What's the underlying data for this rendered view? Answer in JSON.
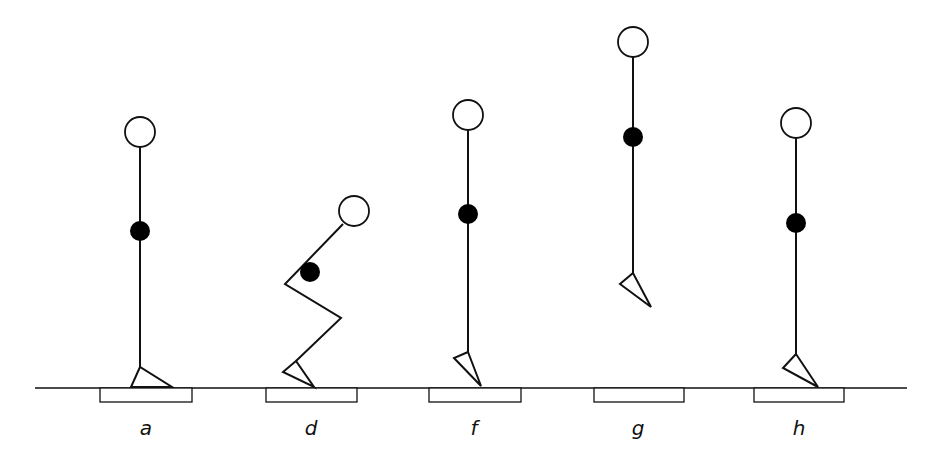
{
  "diagram": {
    "stroke_color": "#111111",
    "com_color": "#000000",
    "head_fill": "#ffffff",
    "ground": {
      "x1": 35,
      "x2": 907,
      "y": 388
    },
    "figures": [
      {
        "label": "a",
        "label_x": 146,
        "plate": {
          "x": 100,
          "w": 92
        },
        "head": {
          "cx": 140,
          "cy": 132,
          "r": 15
        },
        "body": [
          [
            140,
            147
          ],
          [
            140,
            371
          ]
        ],
        "com": {
          "cx": 140,
          "cy": 231,
          "r": 10
        },
        "foot": [
          [
            140,
            367
          ],
          [
            131,
            387
          ],
          [
            172,
            387
          ]
        ]
      },
      {
        "label": "d",
        "label_x": 311,
        "plate": {
          "x": 266,
          "w": 91
        },
        "head": {
          "cx": 354,
          "cy": 211,
          "r": 15
        },
        "body": [
          [
            343,
            224
          ],
          [
            285,
            284
          ],
          [
            341,
            318
          ],
          [
            296,
            361
          ]
        ],
        "com": {
          "cx": 310,
          "cy": 272,
          "r": 10
        },
        "foot": [
          [
            296,
            361
          ],
          [
            283,
            372
          ],
          [
            314,
            387
          ]
        ]
      },
      {
        "label": "f",
        "label_x": 474,
        "plate": {
          "x": 429,
          "w": 92
        },
        "head": {
          "cx": 468,
          "cy": 115,
          "r": 15
        },
        "body": [
          [
            468,
            130
          ],
          [
            468,
            352
          ]
        ],
        "com": {
          "cx": 468,
          "cy": 214,
          "r": 10
        },
        "foot": [
          [
            468,
            352
          ],
          [
            454,
            358
          ],
          [
            481,
            386
          ]
        ]
      },
      {
        "label": "g",
        "label_x": 638,
        "plate": {
          "x": 594,
          "w": 90
        },
        "head": {
          "cx": 633,
          "cy": 42,
          "r": 15
        },
        "body": [
          [
            633,
            57
          ],
          [
            633,
            273
          ]
        ],
        "com": {
          "cx": 633,
          "cy": 137,
          "r": 10
        },
        "foot": [
          [
            633,
            273
          ],
          [
            620,
            284
          ],
          [
            651,
            307
          ]
        ]
      },
      {
        "label": "h",
        "label_x": 799,
        "plate": {
          "x": 754,
          "w": 90
        },
        "head": {
          "cx": 796,
          "cy": 123,
          "r": 15
        },
        "body": [
          [
            796,
            138
          ],
          [
            796,
            354
          ]
        ],
        "com": {
          "cx": 796,
          "cy": 223,
          "r": 10
        },
        "foot": [
          [
            796,
            354
          ],
          [
            783,
            368
          ],
          [
            818,
            387
          ]
        ]
      }
    ]
  }
}
